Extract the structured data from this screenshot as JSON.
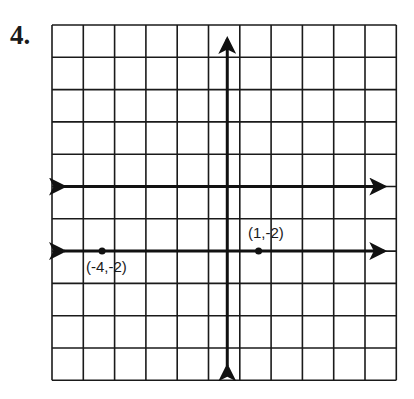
{
  "problem": {
    "number": "4."
  },
  "grid": {
    "cols": 11,
    "rows": 11,
    "left": 52,
    "top": 25,
    "cell_w": 31.3,
    "cell_h": 32.3,
    "line_color": "#1a1a1a"
  },
  "axes": {
    "origin_col": 6,
    "origin_row": 5
  },
  "line": {
    "description": "horizontal line y = -2",
    "y": -2
  },
  "points": [
    {
      "label": "(-4,-2)",
      "x": -4,
      "y": -2
    },
    {
      "label": "(1,-2)",
      "x": 1,
      "y": -2
    }
  ]
}
